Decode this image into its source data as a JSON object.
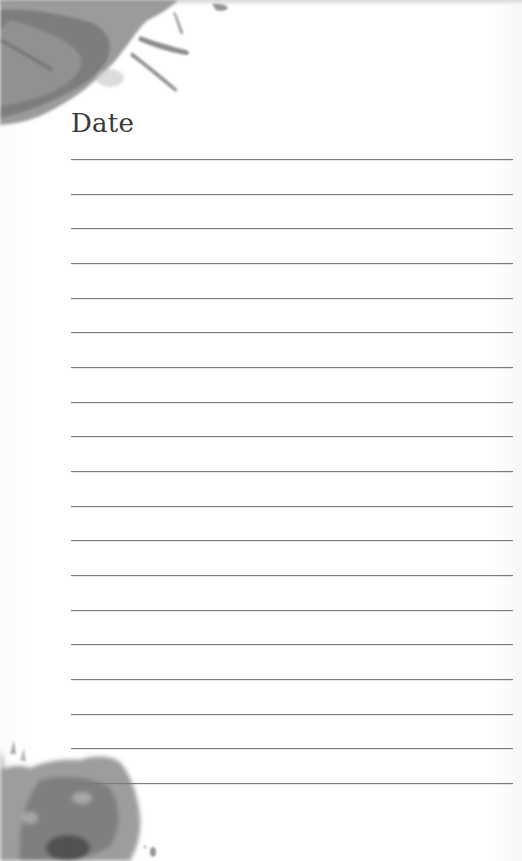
{
  "page": {
    "title": "Date",
    "style": "lined journal page with watercolor splashes",
    "line_count": 19,
    "first_line_y": 159,
    "line_spacing": 34.67,
    "line_color": "#7a7a7a",
    "splash_color": "#6e6e6e"
  }
}
